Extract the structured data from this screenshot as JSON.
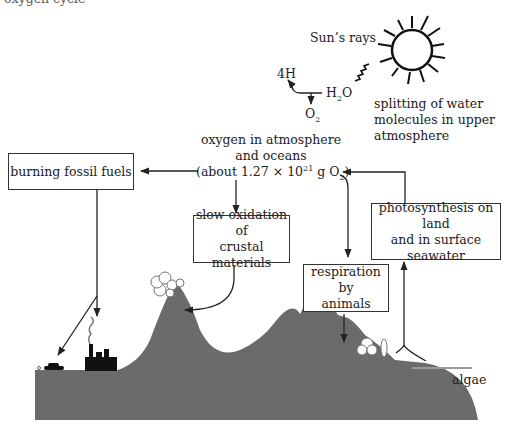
{
  "diagram": {
    "type": "oxygen cycle",
    "header_fragment": "oxygen cycle",
    "sun": {
      "label": "Sun’s rays",
      "icon": "sun-icon"
    },
    "water_splitting": {
      "product_h": "4H",
      "reactant_prefix": "H",
      "reactant_sub": "2",
      "reactant_suffix": "O",
      "product_o_prefix": "O",
      "product_o_sub": "2",
      "caption_line1": "splitting of water",
      "caption_line2": "molecules in upper",
      "caption_line3": "atmosphere"
    },
    "reservoir": {
      "line1": "oxygen in atmosphere",
      "line2": "and oceans",
      "line3_prefix": "(about 1.27 × 10",
      "line3_sup": "21",
      "line3_mid": " g O",
      "line3_sub": "2",
      "line3_suffix": ")"
    },
    "boxes": {
      "fossil": "burning fossil fuels",
      "oxidation_line1": "slow oxidation of",
      "oxidation_line2": "crustal materials",
      "respiration_line1": "respiration by",
      "respiration_line2": "animals",
      "photosynthesis_line1": "photosynthesis on land",
      "photosynthesis_line2": "and in surface",
      "photosynthesis_line3": "seawater"
    },
    "landscape": {
      "algae_label": "algae",
      "ground_color": "#6b6b6b",
      "water_line_color": "#9a9a9a"
    }
  }
}
